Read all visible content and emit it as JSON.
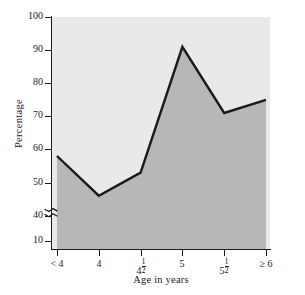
{
  "chart_data": {
    "type": "area",
    "title": "",
    "subtitle": "",
    "xlabel": "Age in years",
    "ylabel": "Percentage",
    "categories": [
      "< 4",
      "4",
      "4½",
      "5",
      "5½",
      "≥ 6"
    ],
    "values": [
      58,
      46,
      53,
      91,
      71,
      75
    ],
    "series": [
      {
        "name": "Percentage",
        "values": [
          58,
          46,
          53,
          91,
          71,
          75
        ]
      }
    ],
    "ylim": [
      10,
      100
    ],
    "ytick_labels": [
      "100",
      "90",
      "80",
      "70",
      "60",
      "50",
      "40",
      "10"
    ],
    "ytick_values": [
      100,
      90,
      80,
      70,
      60,
      50,
      40,
      10
    ],
    "y_axis_break": {
      "present": true,
      "between": [
        40,
        10
      ],
      "style": "zigzag"
    },
    "grid": false,
    "legend": "none",
    "colors": {
      "line": "#1b1b1b",
      "fill_below": "#b7b7b7",
      "fill_above": "#e9e9e9",
      "axis": "#1b1b1b",
      "text": "#1b1b1b",
      "background": "#ffffff"
    }
  },
  "axes": {
    "y_ticks": [
      {
        "label": "100",
        "value": 100
      },
      {
        "label": "90",
        "value": 90
      },
      {
        "label": "80",
        "value": 80
      },
      {
        "label": "70",
        "value": 70
      },
      {
        "label": "60",
        "value": 60
      },
      {
        "label": "50",
        "value": 50
      },
      {
        "label": "40",
        "value": 40
      },
      {
        "label": "10",
        "value": 10
      }
    ],
    "x_ticks": [
      {
        "label": "< 4",
        "whole": "< 4",
        "fraction": null
      },
      {
        "label": "4",
        "whole": "4",
        "fraction": null
      },
      {
        "label": "4½",
        "whole": "4",
        "fraction": "1/2"
      },
      {
        "label": "5",
        "whole": "5",
        "fraction": null
      },
      {
        "label": "5½",
        "whole": "5",
        "fraction": "1/2"
      },
      {
        "label": "≥ 6",
        "whole": "≥ 6",
        "fraction": null
      }
    ],
    "y_title": "Percentage",
    "x_title": "Age in years"
  }
}
